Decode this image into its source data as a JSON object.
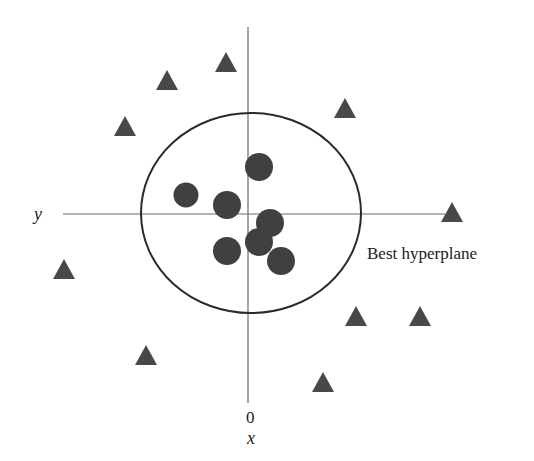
{
  "diagram": {
    "title": "",
    "axes": {
      "horizontal": {
        "label": "y",
        "x1": 63,
        "x2": 445,
        "y": 214
      },
      "vertical": {
        "label": "x",
        "origin_label": "0",
        "x": 248,
        "y1": 27,
        "y2": 403
      }
    },
    "boundary": {
      "label": "Best hyperplane",
      "shape": "ellipse",
      "cx": 251,
      "cy": 213,
      "rx": 110,
      "ry": 100
    },
    "colors": {
      "points": "#404040",
      "triangles": "#484848",
      "axis": "#6a6a6a",
      "boundary": "#2a2a2a",
      "background": "#ffffff"
    },
    "circles_class": [
      {
        "cx": 259,
        "cy": 167,
        "r": 14
      },
      {
        "cx": 186,
        "cy": 195,
        "r": 12.5
      },
      {
        "cx": 227,
        "cy": 205,
        "r": 14
      },
      {
        "cx": 270,
        "cy": 223,
        "r": 14
      },
      {
        "cx": 259,
        "cy": 242,
        "r": 14
      },
      {
        "cx": 227,
        "cy": 251,
        "r": 14
      },
      {
        "cx": 281,
        "cy": 261,
        "r": 14
      }
    ],
    "triangles_class": [
      {
        "cx": 226,
        "cy": 62
      },
      {
        "cx": 167,
        "cy": 80
      },
      {
        "cx": 125,
        "cy": 126
      },
      {
        "cx": 345,
        "cy": 108
      },
      {
        "cx": 452,
        "cy": 212
      },
      {
        "cx": 64,
        "cy": 269
      },
      {
        "cx": 356,
        "cy": 316
      },
      {
        "cx": 420,
        "cy": 316
      },
      {
        "cx": 146,
        "cy": 355
      },
      {
        "cx": 323,
        "cy": 382
      }
    ]
  }
}
